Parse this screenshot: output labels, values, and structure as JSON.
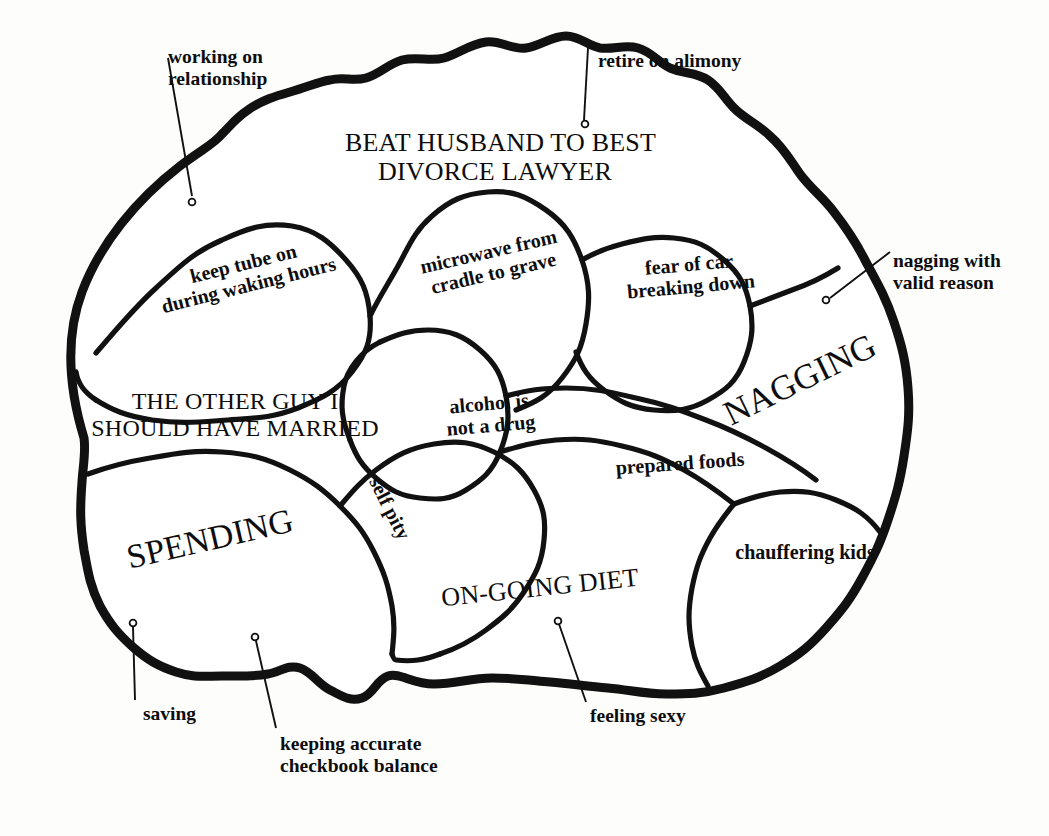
{
  "figure": {
    "kind": "satirical-brain-map",
    "background_color": "#fdfdfc",
    "ink_color": "#111111"
  },
  "regions": [
    {
      "id": "beat-husband",
      "label": "BEAT HUSBAND TO BEST\nDIVORCE LAWYER",
      "style": "caps",
      "size": 26,
      "rotate": 0,
      "x": 345,
      "y": 128,
      "w": 300
    },
    {
      "id": "keep-tube",
      "label": "keep tube on\nduring waking hours",
      "style": "inner",
      "size": 20,
      "rotate": -14,
      "x": 136,
      "y": 252,
      "w": 220
    },
    {
      "id": "microwave",
      "label": "microwave from\ncradle to grave",
      "style": "inner",
      "size": 20,
      "rotate": -13,
      "x": 396,
      "y": 240,
      "w": 190
    },
    {
      "id": "fear-of-car",
      "label": "fear of car\nbreaking down",
      "style": "inner",
      "size": 20,
      "rotate": -5,
      "x": 600,
      "y": 253,
      "w": 180
    },
    {
      "id": "other-guy",
      "label": "THE OTHER GUY I\nSHOULD HAVE MARRIED",
      "style": "caps",
      "size": 24,
      "rotate": 0,
      "x": 70,
      "y": 388,
      "w": 330
    },
    {
      "id": "alcohol",
      "label": "alcohol is\nnot a drug",
      "style": "inner",
      "size": 20,
      "rotate": -5,
      "x": 420,
      "y": 392,
      "w": 140
    },
    {
      "id": "nagging",
      "label": "NAGGING",
      "style": "caps",
      "size": 35,
      "rotate": -26,
      "x": 700,
      "y": 360,
      "w": 200
    },
    {
      "id": "prepared-foods",
      "label": "prepared foods",
      "style": "inner",
      "size": 20,
      "rotate": -4,
      "x": 590,
      "y": 452,
      "w": 180
    },
    {
      "id": "spending",
      "label": "SPENDING",
      "style": "caps",
      "size": 34,
      "rotate": -13,
      "x": 100,
      "y": 520,
      "w": 220
    },
    {
      "id": "self-pity",
      "label": "self pity",
      "style": "inner",
      "size": 20,
      "rotate": 63,
      "x": 340,
      "y": 497,
      "w": 100
    },
    {
      "id": "ongoing-diet",
      "label": "ON-GOING DIET",
      "style": "caps",
      "size": 26,
      "rotate": -6,
      "x": 430,
      "y": 573,
      "w": 220
    },
    {
      "id": "chauffering-kids",
      "label": "chauffering kids",
      "style": "inner",
      "size": 20,
      "rotate": 0,
      "x": 715,
      "y": 541,
      "w": 180
    }
  ],
  "callouts": [
    {
      "id": "working-on-relationship",
      "label": "working on\nrelationship",
      "align": "left",
      "x": 168,
      "y": 46,
      "w": 150,
      "leader": {
        "x1": 168,
        "y1": 58,
        "x2": 192,
        "y2": 196
      },
      "dot": {
        "cx": 192,
        "cy": 202,
        "r": 3.4
      }
    },
    {
      "id": "retire-on-alimony",
      "label": "retire on alimony",
      "align": "left",
      "x": 598,
      "y": 50,
      "w": 190,
      "leader": {
        "x1": 588,
        "y1": 48,
        "x2": 584,
        "y2": 120
      },
      "dot": {
        "cx": 585,
        "cy": 124,
        "r": 3.4
      }
    },
    {
      "id": "nagging-with-valid-reason",
      "label": "nagging with\nvalid reason",
      "align": "left",
      "x": 893,
      "y": 250,
      "w": 160,
      "leader": {
        "x1": 890,
        "y1": 252,
        "x2": 830,
        "y2": 298
      },
      "dot": {
        "cx": 826,
        "cy": 300,
        "r": 3.4
      }
    },
    {
      "id": "saving",
      "label": "saving",
      "align": "left",
      "x": 143,
      "y": 703,
      "w": 90,
      "leader": {
        "x1": 135,
        "y1": 700,
        "x2": 133,
        "y2": 627
      },
      "dot": {
        "cx": 133,
        "cy": 623,
        "r": 3.4
      }
    },
    {
      "id": "keeping-accurate",
      "label": "keeping accurate\ncheckbook balance",
      "align": "left",
      "x": 280,
      "y": 733,
      "w": 200,
      "leader": {
        "x1": 276,
        "y1": 728,
        "x2": 256,
        "y2": 641
      },
      "dot": {
        "cx": 255,
        "cy": 637,
        "r": 3.4
      }
    },
    {
      "id": "feeling-sexy",
      "label": "feeling sexy",
      "align": "left",
      "x": 590,
      "y": 705,
      "w": 130,
      "leader": {
        "x1": 586,
        "y1": 702,
        "x2": 559,
        "y2": 624
      },
      "dot": {
        "cx": 558,
        "cy": 621,
        "r": 3.4
      }
    }
  ],
  "shapes": {
    "outline": "M 84 438 C 70 392 64 340 82 292 C 100 244 136 200 180 166 C 204 148 214 144 222 134 C 232 124 236 118 248 110 C 262 100 276 96 290 92 C 310 86 318 82 330 80 C 344 76 352 82 366 78 C 380 74 388 64 402 60 C 418 56 430 62 444 58 C 458 54 470 44 486 42 C 500 40 512 50 526 48 C 540 46 552 36 566 36 C 580 36 588 46 600 48 C 614 50 624 44 638 48 C 652 52 658 62 670 68 C 684 74 696 72 708 80 C 720 88 724 98 734 108 C 746 120 758 124 770 136 C 784 148 790 160 800 174 C 812 190 822 196 834 212 C 848 230 856 242 866 262 C 878 284 886 298 894 322 C 902 346 906 362 908 388 C 910 414 908 430 904 456 C 900 482 896 496 888 520 C 880 544 874 556 862 578 C 850 600 842 610 826 628 C 810 646 800 654 780 666 C 760 678 746 682 724 688 C 702 694 688 694 666 694 C 644 694 630 690 608 688 C 586 686 572 684 550 682 C 528 680 514 678 492 678 C 470 678 456 684 434 684 C 412 684 400 672 388 676 C 376 680 374 694 362 698 C 350 702 342 696 330 690 C 318 684 312 672 300 668 C 288 664 280 672 268 674 C 250 677 240 676 222 676 C 204 676 194 678 176 672 C 158 666 148 660 134 648 C 118 634 110 624 100 606 C 90 586 88 572 84 550 C 80 524 80 508 82 482 C 83 466 86 452 84 438 Z",
    "lobes": [
      "M 96 353 C 116 330 132 310 156 288 C 180 266 194 252 222 240 C 248 228 266 222 292 226 C 316 230 330 242 346 260 C 362 278 368 292 370 316 C 372 340 366 354 352 372 C 336 392 322 398 298 408 C 272 418 256 418 228 420 C 198 422 182 424 152 420 C 126 416 112 410 96 400",
      "M 96 400 C 84 392 78 384 76 372",
      "M 370 316 C 380 296 388 284 398 266 C 410 244 414 232 432 216 C 450 200 464 194 488 192 C 512 190 526 196 546 210 C 566 224 574 238 582 260 C 590 284 590 300 586 324 C 582 348 576 360 562 378 C 548 396 536 402 516 410",
      "M 582 260 C 596 252 606 248 622 244 C 642 239 654 236 674 238 C 696 240 708 246 724 260 C 740 274 746 286 750 306 C 754 328 752 342 744 362 C 736 382 726 390 708 400 C 690 410 676 412 654 410 C 632 408 620 402 604 390 C 588 378 582 368 576 352",
      "M 750 306 C 766 300 776 296 792 290 C 812 283 822 278 838 268",
      "M 380 342 C 398 334 410 330 428 330 C 450 330 464 336 480 350 C 496 364 502 376 506 396 C 510 418 508 432 500 452 C 492 472 482 480 466 490 C 450 500 438 500 420 498 C 400 496 390 490 376 478 C 362 466 356 456 350 440",
      "M 350 440 C 342 420 340 406 344 386 C 347 370 360 352 380 342",
      "M 506 396 C 528 390 542 388 566 388 C 594 388 610 392 636 398 C 664 404 680 410 706 420 C 730 429 744 436 766 448 C 786 459 798 466 816 480",
      "M 500 452 C 520 446 534 442 556 440 C 582 438 598 440 622 446 C 648 452 662 458 684 470 C 704 481 716 490 734 504",
      "M 734 504 C 750 498 762 494 780 492 C 802 490 816 492 836 500 C 856 508 868 516 880 532",
      "M 734 504 C 724 516 718 524 710 538 C 700 556 696 568 692 588 C 688 610 688 624 692 646 C 695 662 700 672 708 686",
      "M 88 474 C 110 466 126 462 150 458 C 178 453 194 450 222 452 C 250 454 266 458 290 470 C 312 481 324 490 340 506 C 356 522 364 532 374 552 C 384 572 388 584 392 606 C 395 624 394 636 392 654",
      "M 340 506 C 352 492 360 482 376 470 C 396 455 410 448 434 444 C 458 440 473 442 494 452 C 514 462 524 472 534 490 C 544 508 546 520 544 540 C 542 562 536 574 524 592 C 512 610 502 618 486 630 C 470 642 458 648 440 654",
      "M 440 654 C 424 660 412 662 396 660 C 394 660 393 657 392 654"
    ]
  }
}
